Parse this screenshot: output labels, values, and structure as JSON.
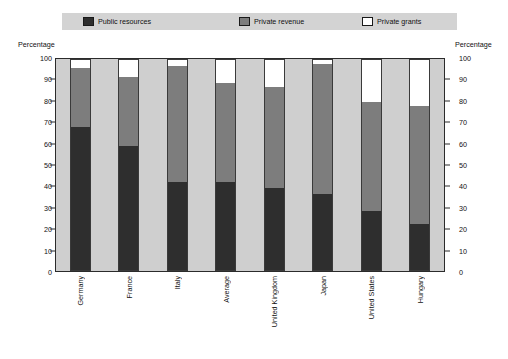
{
  "chart_data": {
    "type": "bar",
    "subtype": "stacked-bar-100",
    "title": "",
    "xlabel": "",
    "ylabel": "Percentage",
    "ylabel_right": "Percentage",
    "ylim": [
      0,
      100
    ],
    "ytick_step": 10,
    "yticks": [
      100,
      90,
      80,
      70,
      60,
      50,
      40,
      30,
      20,
      10,
      0
    ],
    "grid": false,
    "legend_position": "top",
    "categories": [
      "Germany",
      "France",
      "Italy",
      "Average",
      "United Kingdom",
      "Japan",
      "United States",
      "Hungary"
    ],
    "series": [
      {
        "name": "Public resources",
        "color": "#2e2e2e",
        "values": [
          68,
          59,
          42,
          42,
          39,
          36,
          28,
          22
        ]
      },
      {
        "name": "Private revenue",
        "color": "#7d7d7d",
        "values": [
          28,
          33,
          55,
          47,
          48,
          62,
          52,
          56
        ]
      },
      {
        "name": "Private grants",
        "color": "#ffffff",
        "values": [
          4,
          8,
          3,
          11,
          13,
          2,
          20,
          22
        ]
      }
    ]
  },
  "legend": {
    "entries": [
      {
        "label": "Public resources",
        "swatch": "#2e2e2e"
      },
      {
        "label": "Private revenue",
        "swatch": "#7d7d7d"
      },
      {
        "label": "Private grants",
        "swatch": "#ffffff"
      }
    ]
  },
  "axes": {
    "left_title": "Percentage",
    "right_title": "Percentage"
  },
  "colors": {
    "plot_background": "#cfcfcf",
    "legend_background": "#d3d3d3",
    "axis_line": "#2b2b2b",
    "text": "#111111",
    "page_background": "#ffffff"
  }
}
